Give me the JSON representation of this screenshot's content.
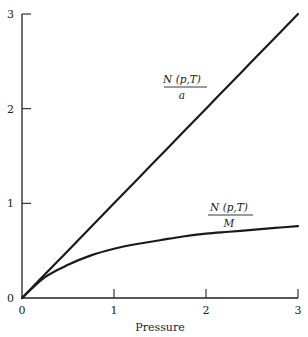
{
  "chart_data": {
    "type": "line",
    "title": "",
    "xlabel": "Pressure",
    "ylabel": "",
    "xlim": [
      0,
      3
    ],
    "ylim": [
      0,
      3
    ],
    "grid": false,
    "x_ticks": [
      "0",
      "1",
      "2",
      "3"
    ],
    "y_ticks": [
      "0",
      "1",
      "2",
      "3"
    ],
    "x": [
      0,
      0.25,
      0.5,
      0.75,
      1,
      1.25,
      1.5,
      1.75,
      2,
      2.25,
      2.5,
      2.75,
      3
    ],
    "series": [
      {
        "name": "N(p,T)/a",
        "values": [
          0,
          0.25,
          0.5,
          0.75,
          1,
          1.25,
          1.5,
          1.75,
          2,
          2.25,
          2.5,
          2.75,
          3
        ]
      },
      {
        "name": "N(p,T)/M",
        "values": [
          0,
          0.22,
          0.35,
          0.45,
          0.52,
          0.57,
          0.61,
          0.65,
          0.68,
          0.7,
          0.72,
          0.74,
          0.76
        ]
      }
    ],
    "annotations": [
      {
        "series": "N(p,T)/a",
        "numerator": "N (p,T)",
        "denominator": "a",
        "x": 1.74,
        "y": 2.23
      },
      {
        "series": "N(p,T)/M",
        "numerator": "N (p,T)",
        "denominator": "M",
        "x": 2.24,
        "y": 0.87
      }
    ]
  },
  "labels": {
    "x_axis_title": "Pressure",
    "y_origin": "0",
    "annotation_a_num": "N (p,T)",
    "annotation_a_den": "a",
    "annotation_m_num": "N (p,T)",
    "annotation_m_den": "M"
  }
}
